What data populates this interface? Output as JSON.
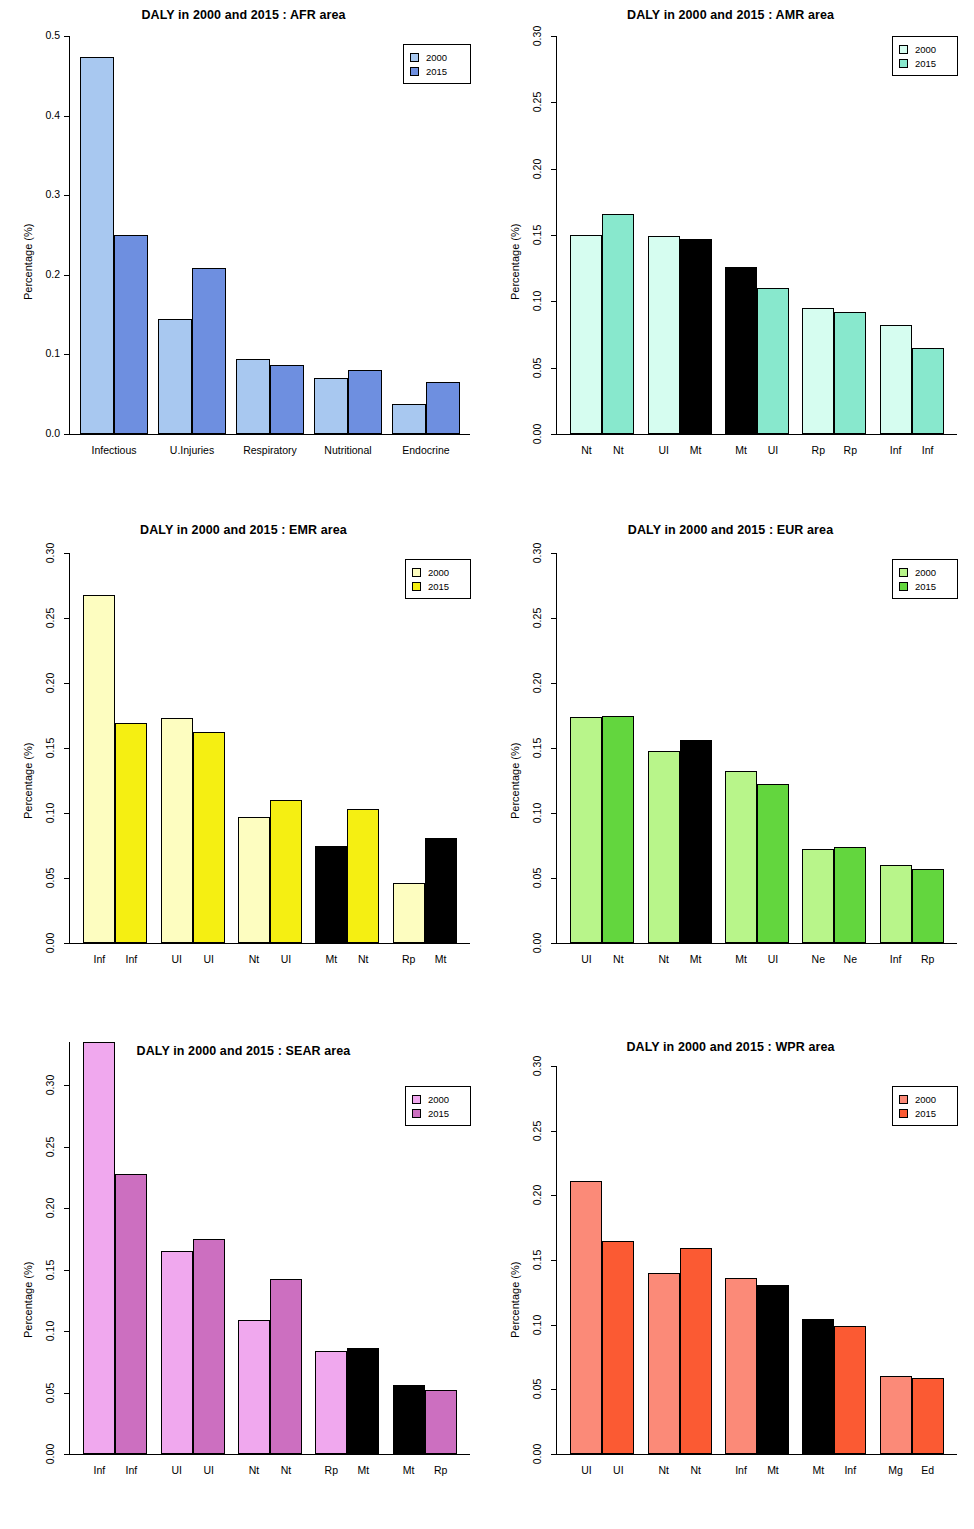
{
  "chart_data": [
    {
      "type": "bar",
      "title": "DALY in 2000 and 2015 : AFR area",
      "ylabel": "Percentage (%)",
      "xlabel": "",
      "ylim": [
        0,
        0.5
      ],
      "yticks": [
        "0.0",
        "0.1",
        "0.2",
        "0.3",
        "0.4",
        "0.5"
      ],
      "ytickvals": [
        0.0,
        0.1,
        0.2,
        0.3,
        0.4,
        0.5
      ],
      "grid": false,
      "legend": [
        "2000",
        "2015"
      ],
      "legend_position": "top-right",
      "colors": {
        "y2000": "#a8c8f0",
        "y2015": "#6e8fe0",
        "black": "#000000"
      },
      "categories": [
        "Infectious",
        "U.Injuries",
        "Respiratory",
        "Nutritional",
        "Endocrine"
      ],
      "cat_labels_2000": [
        "Infectious",
        "U.Injuries",
        "Respiratory",
        "Nutritional",
        "Endocrine"
      ],
      "cat_labels_2015": [
        "",
        "",
        "",
        "",
        ""
      ],
      "series": [
        {
          "name": "2000",
          "values": [
            0.474,
            0.145,
            0.094,
            0.07,
            0.038
          ],
          "black": [
            false,
            false,
            false,
            false,
            false
          ]
        },
        {
          "name": "2015",
          "values": [
            0.25,
            0.208,
            0.087,
            0.081,
            0.065
          ],
          "black": [
            false,
            false,
            false,
            false,
            false
          ]
        }
      ]
    },
    {
      "type": "bar",
      "title": "DALY in 2000 and 2015 : AMR area",
      "ylabel": "Percentage (%)",
      "xlabel": "",
      "ylim": [
        0,
        0.3
      ],
      "yticks": [
        "0.00",
        "0.05",
        "0.10",
        "0.15",
        "0.20",
        "0.25",
        "0.30"
      ],
      "ytickvals": [
        0.0,
        0.05,
        0.1,
        0.15,
        0.2,
        0.25,
        0.3
      ],
      "grid": false,
      "legend": [
        "2000",
        "2015"
      ],
      "legend_position": "top-right",
      "colors": {
        "y2000": "#d6fdf0",
        "y2015": "#88e8cd",
        "black": "#000000"
      },
      "cat_labels_2000": [
        "Nt",
        "UI",
        "Mt",
        "Rp",
        "Inf"
      ],
      "cat_labels_2015": [
        "Nt",
        "Mt",
        "UI",
        "Rp",
        "Inf"
      ],
      "series": [
        {
          "name": "2000",
          "values": [
            0.15,
            0.149,
            0.126,
            0.095,
            0.082
          ],
          "black": [
            false,
            false,
            true,
            false,
            false
          ]
        },
        {
          "name": "2015",
          "values": [
            0.166,
            0.147,
            0.11,
            0.092,
            0.065
          ],
          "black": [
            false,
            true,
            false,
            false,
            false
          ]
        }
      ]
    },
    {
      "type": "bar",
      "title": "DALY in 2000 and 2015 : EMR area",
      "ylabel": "Percentage (%)",
      "xlabel": "",
      "ylim": [
        0,
        0.3
      ],
      "yticks": [
        "0.00",
        "0.05",
        "0.10",
        "0.15",
        "0.20",
        "0.25",
        "0.30"
      ],
      "ytickvals": [
        0.0,
        0.05,
        0.1,
        0.15,
        0.2,
        0.25,
        0.3
      ],
      "grid": false,
      "legend": [
        "2000",
        "2015"
      ],
      "legend_position": "top-right",
      "colors": {
        "y2000": "#fdfdc0",
        "y2015": "#f5ef12",
        "black": "#000000"
      },
      "cat_labels_2000": [
        "Inf",
        "UI",
        "Nt",
        "Mt",
        "Rp"
      ],
      "cat_labels_2015": [
        "Inf",
        "UI",
        "UI",
        "Nt",
        "Mt"
      ],
      "series": [
        {
          "name": "2000",
          "values": [
            0.268,
            0.173,
            0.097,
            0.075,
            0.046
          ],
          "black": [
            false,
            false,
            false,
            true,
            false
          ]
        },
        {
          "name": "2015",
          "values": [
            0.169,
            0.162,
            0.11,
            0.103,
            0.081
          ],
          "black": [
            false,
            false,
            false,
            false,
            true
          ]
        }
      ]
    },
    {
      "type": "bar",
      "title": "DALY in 2000 and 2015 : EUR area",
      "ylabel": "Percentage (%)",
      "xlabel": "",
      "ylim": [
        0,
        0.3
      ],
      "yticks": [
        "0.00",
        "0.05",
        "0.10",
        "0.15",
        "0.20",
        "0.25",
        "0.30"
      ],
      "ytickvals": [
        0.0,
        0.05,
        0.1,
        0.15,
        0.2,
        0.25,
        0.3
      ],
      "grid": false,
      "legend": [
        "2000",
        "2015"
      ],
      "legend_position": "top-right",
      "colors": {
        "y2000": "#b8f58a",
        "y2015": "#63d63e",
        "black": "#000000"
      },
      "cat_labels_2000": [
        "UI",
        "Nt",
        "Mt",
        "Ne",
        "Inf"
      ],
      "cat_labels_2015": [
        "Nt",
        "Mt",
        "UI",
        "Ne",
        "Rp"
      ],
      "series": [
        {
          "name": "2000",
          "values": [
            0.174,
            0.148,
            0.132,
            0.072,
            0.06
          ],
          "black": [
            false,
            false,
            false,
            false,
            false
          ]
        },
        {
          "name": "2015",
          "values": [
            0.175,
            0.156,
            0.122,
            0.074,
            0.057
          ],
          "black": [
            false,
            true,
            false,
            false,
            false
          ]
        }
      ]
    },
    {
      "type": "bar",
      "title": "DALY in 2000 and 2015 : SEAR area",
      "ylabel": "Percentage (%)",
      "xlabel": "",
      "ylim": [
        0,
        0.335
      ],
      "yticks": [
        "0.00",
        "0.05",
        "0.10",
        "0.15",
        "0.20",
        "0.25",
        "0.30"
      ],
      "ytickvals": [
        0.0,
        0.05,
        0.1,
        0.15,
        0.2,
        0.25,
        0.3
      ],
      "grid": false,
      "legend": [
        "2000",
        "2015"
      ],
      "legend_position": "top-right",
      "colors": {
        "y2000": "#f0a8ee",
        "y2015": "#cc6fc0",
        "black": "#000000"
      },
      "cat_labels_2000": [
        "Inf",
        "UI",
        "Nt",
        "Rp",
        "Mt"
      ],
      "cat_labels_2015": [
        "Inf",
        "UI",
        "Nt",
        "Mt",
        "Rp"
      ],
      "series": [
        {
          "name": "2000",
          "values": [
            0.335,
            0.165,
            0.109,
            0.084,
            0.056
          ],
          "black": [
            false,
            false,
            false,
            false,
            true
          ]
        },
        {
          "name": "2015",
          "values": [
            0.228,
            0.175,
            0.142,
            0.086,
            0.052
          ],
          "black": [
            false,
            false,
            false,
            true,
            false
          ]
        }
      ]
    },
    {
      "type": "bar",
      "title": "DALY in 2000 and 2015 : WPR area",
      "ylabel": "Percentage (%)",
      "xlabel": "",
      "ylim": [
        0,
        0.3
      ],
      "yticks": [
        "0.00",
        "0.05",
        "0.10",
        "0.15",
        "0.20",
        "0.25",
        "0.30"
      ],
      "ytickvals": [
        0.0,
        0.05,
        0.1,
        0.15,
        0.2,
        0.25,
        0.3
      ],
      "grid": false,
      "legend": [
        "2000",
        "2015"
      ],
      "legend_position": "top-right",
      "colors": {
        "y2000": "#fb8a78",
        "y2015": "#fb5a33",
        "black": "#000000"
      },
      "cat_labels_2000": [
        "UI",
        "Nt",
        "Inf",
        "Mt",
        "Mg"
      ],
      "cat_labels_2015": [
        "UI",
        "Nt",
        "Mt",
        "Inf",
        "Ed"
      ],
      "series": [
        {
          "name": "2000",
          "values": [
            0.211,
            0.14,
            0.136,
            0.104,
            0.06
          ],
          "black": [
            false,
            false,
            false,
            true,
            false
          ]
        },
        {
          "name": "2015",
          "values": [
            0.165,
            0.159,
            0.131,
            0.099,
            0.059
          ],
          "black": [
            false,
            false,
            true,
            false,
            false
          ]
        }
      ]
    }
  ]
}
